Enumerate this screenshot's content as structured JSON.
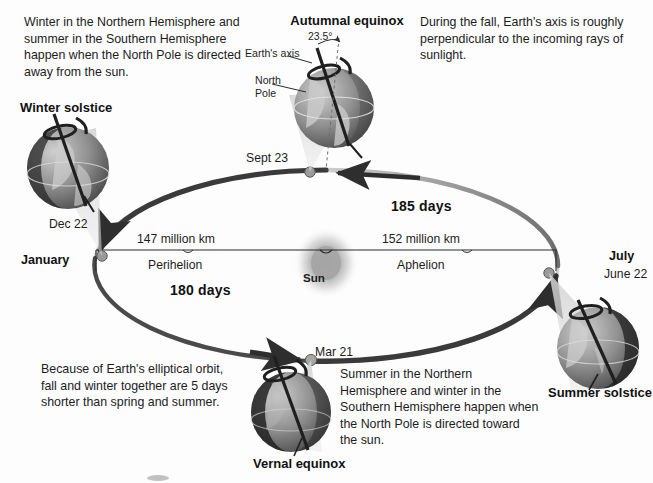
{
  "diagram": {
    "paragraphs": {
      "winter_northern": "Winter in the Northern Hemisphere and summer in the Southern Hemisphere happen when the North Pole is directed away from the sun.",
      "fall_axis": "During the fall, Earth's axis is roughly perpendicular to the incoming rays of sunlight.",
      "elliptical_orbit": "Because of Earth's elliptical orbit, fall and winter together are 5 days shorter than spring and summer.",
      "summer_northern": "Summer in the Northern Hemisphere and winter in the Southern Hemisphere happen when the North Pole is directed toward the sun."
    },
    "season_labels": {
      "autumnal_equinox": "Autumnal equinox",
      "winter_solstice": "Winter solstice",
      "summer_solstice": "Summer solstice",
      "vernal_equinox": "Vernal equinox"
    },
    "axis_callouts": {
      "tilt_angle": "23.5°",
      "earths_axis": "Earth's axis",
      "north_pole": "North\nPole"
    },
    "orbit_dates": {
      "sept23": "Sept 23",
      "dec22": "Dec 22",
      "january": "January",
      "july": "July",
      "june22": "June 22",
      "mar21": "Mar 21"
    },
    "distances": {
      "perihelion_distance": "147 million km",
      "perihelion_label": "Perihelion",
      "aphelion_distance": "152 million km",
      "aphelion_label": "Aphelion",
      "sun_label": "Sun"
    },
    "durations": {
      "upper_half": "185 days",
      "lower_half": "180 days"
    },
    "colors": {
      "background": "#fdfdfd",
      "text": "#1c1c1c",
      "orbit_stroke": "#3a3a3a",
      "orbit_faint": "#b9b9b9",
      "sun_core": "#a8a8a8",
      "globe_light": "#b9b9b9",
      "globe_dark": "#2c2c2c",
      "light_cone": "#d9d9d9"
    }
  }
}
